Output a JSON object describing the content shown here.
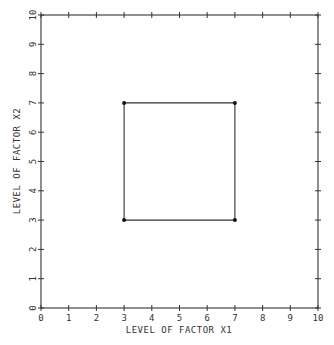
{
  "chart_data": {
    "type": "line",
    "title": "",
    "xlabel": "LEVEL OF FACTOR X1",
    "ylabel": "LEVEL OF FACTOR X2",
    "xlim": [
      0,
      10
    ],
    "ylim": [
      0,
      10
    ],
    "xticks": [
      "0",
      "1",
      "2",
      "3",
      "4",
      "5",
      "6",
      "7",
      "8",
      "9",
      "10"
    ],
    "yticks": [
      "0",
      "1",
      "2",
      "3",
      "4",
      "5",
      "6",
      "7",
      "8",
      "9",
      "10"
    ],
    "grid": false,
    "legend": null,
    "series": [
      {
        "name": "design-square",
        "closed": true,
        "points": [
          [
            3,
            3
          ],
          [
            7,
            3
          ],
          [
            7,
            7
          ],
          [
            3,
            7
          ]
        ]
      }
    ]
  },
  "colors": {
    "axis": "#333333",
    "line": "#333333",
    "marker": "#111111",
    "background": "#ffffff"
  }
}
